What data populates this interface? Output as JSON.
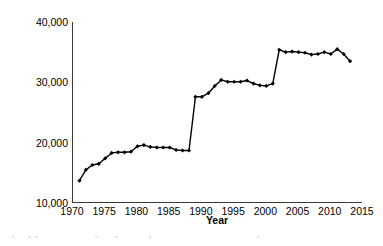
{
  "chart_data": {
    "type": "line",
    "title": "",
    "xlabel": "Year",
    "ylabel": "Total liquid pipelines in Europe (km)",
    "xlim": [
      1970,
      2015
    ],
    "ylim": [
      10000,
      40000
    ],
    "xticks": [
      1970,
      1975,
      1980,
      1985,
      1990,
      1995,
      2000,
      2005,
      2010,
      2015
    ],
    "xtick_labels": [
      "1970",
      "1975",
      "1980",
      "1985",
      "1990",
      "1995",
      "2000",
      "2005",
      "2010",
      "2015"
    ],
    "yticks": [
      10000,
      20000,
      30000,
      40000
    ],
    "ytick_labels": [
      "10,000",
      "20,000",
      "30,000",
      "40,000"
    ],
    "grid": false,
    "legend": null,
    "marker": "diamond",
    "line_color": "#000000",
    "marker_color": "#000000",
    "x": [
      1971,
      1972,
      1973,
      1974,
      1975,
      1976,
      1977,
      1978,
      1979,
      1980,
      1981,
      1982,
      1983,
      1984,
      1985,
      1986,
      1987,
      1988,
      1989,
      1990,
      1991,
      1992,
      1993,
      1994,
      1995,
      1996,
      1997,
      1998,
      1999,
      2000,
      2001,
      2002,
      2003,
      2004,
      2005,
      2006,
      2007,
      2008,
      2009,
      2010,
      2011,
      2012,
      2013
    ],
    "values": [
      13700,
      15500,
      16300,
      16500,
      17400,
      18300,
      18400,
      18400,
      18500,
      19400,
      19600,
      19300,
      19200,
      19200,
      19200,
      18800,
      18700,
      18700,
      27600,
      27600,
      28200,
      29400,
      30400,
      30100,
      30100,
      30100,
      30300,
      29800,
      29500,
      29400,
      29800,
      35400,
      35000,
      35100,
      35000,
      34900,
      34600,
      34700,
      35000,
      34700,
      35500,
      34700,
      33500
    ]
  },
  "caption": {
    "clipped_line": "Liquid pipelines in Europe reported by CONCAWE member companies over time"
  }
}
